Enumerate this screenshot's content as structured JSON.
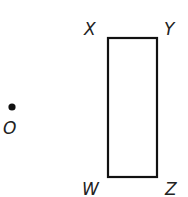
{
  "diagram": {
    "type": "geometry-figure",
    "rectangle": {
      "vertices": {
        "X": {
          "label": "X",
          "x": 108,
          "y": 38
        },
        "Y": {
          "label": "Y",
          "x": 157,
          "y": 38
        },
        "Z": {
          "label": "Z",
          "x": 157,
          "y": 177
        },
        "W": {
          "label": "W",
          "x": 108,
          "y": 177
        }
      },
      "stroke_color": "#111111"
    },
    "point": {
      "label": "O",
      "x": 12,
      "y": 107
    }
  }
}
